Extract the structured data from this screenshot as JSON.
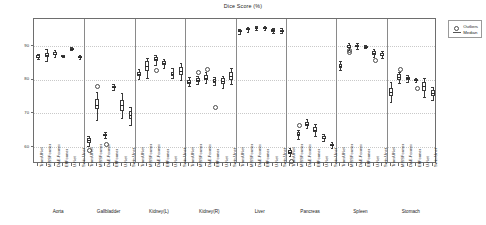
{
  "chart_data": {
    "type": "box",
    "title": "Dice Score (%)",
    "xlabel": "",
    "ylabel": "",
    "ylim": [
      55,
      98
    ],
    "yticks": [
      60,
      70,
      80,
      90
    ],
    "grid": true,
    "legend_position": "top-right",
    "legend": [
      {
        "label": "Outliers",
        "marker": "circle"
      },
      {
        "label": "Median",
        "marker": "line"
      }
    ],
    "models": [
      "TransUNet",
      "MISSFormer",
      "DAE-Former",
      "EffFormer",
      "U-Net",
      "Swin-Unet"
    ],
    "groups": [
      {
        "name": "Aorta",
        "boxes": [
          {
            "model": "TransUNet",
            "whisker_low": 86.0,
            "q1": 86.4,
            "median": 86.8,
            "q3": 87.2,
            "whisker_high": 87.6,
            "outliers": []
          },
          {
            "model": "MISSFormer",
            "whisker_low": 85.6,
            "q1": 86.8,
            "median": 87.4,
            "q3": 88.0,
            "whisker_high": 89.2,
            "outliers": []
          },
          {
            "model": "DAE-Former",
            "whisker_low": 86.6,
            "q1": 87.2,
            "median": 87.7,
            "q3": 88.2,
            "whisker_high": 88.8,
            "outliers": []
          },
          {
            "model": "EffFormer",
            "whisker_low": 86.6,
            "q1": 86.8,
            "median": 87.0,
            "q3": 87.2,
            "whisker_high": 87.4,
            "outliers": []
          },
          {
            "model": "U-Net",
            "whisker_low": 88.8,
            "q1": 89.0,
            "median": 89.2,
            "q3": 89.4,
            "whisker_high": 89.6,
            "outliers": []
          },
          {
            "model": "Swin-Unet",
            "whisker_low": 86.0,
            "q1": 86.3,
            "median": 86.6,
            "q3": 86.9,
            "whisker_high": 87.2,
            "outliers": []
          }
        ]
      },
      {
        "name": "Gallbladder",
        "boxes": [
          {
            "model": "TransUNet",
            "whisker_low": 60.4,
            "q1": 61.2,
            "median": 62.0,
            "q3": 62.8,
            "whisker_high": 63.4,
            "outliers": [
              59.2
            ]
          },
          {
            "model": "MISSFormer",
            "whisker_low": 68.0,
            "q1": 71.2,
            "median": 72.6,
            "q3": 74.2,
            "whisker_high": 76.4,
            "outliers": [
              78.4
            ]
          },
          {
            "model": "DAE-Former",
            "whisker_low": 62.8,
            "q1": 63.2,
            "median": 63.6,
            "q3": 64.0,
            "whisker_high": 64.4,
            "outliers": [
              61.0
            ]
          },
          {
            "model": "EffFormer",
            "whisker_low": 77.0,
            "q1": 77.4,
            "median": 77.8,
            "q3": 78.2,
            "whisker_high": 78.6,
            "outliers": []
          },
          {
            "model": "U-Net",
            "whisker_low": 68.6,
            "q1": 70.8,
            "median": 72.4,
            "q3": 74.0,
            "whisker_high": 76.0,
            "outliers": []
          },
          {
            "model": "Swin-Unet",
            "whisker_low": 66.6,
            "q1": 68.2,
            "median": 69.4,
            "q3": 70.6,
            "whisker_high": 72.0,
            "outliers": []
          }
        ]
      },
      {
        "name": "Kidney(L)",
        "boxes": [
          {
            "model": "TransUNet",
            "whisker_low": 80.2,
            "q1": 81.2,
            "median": 81.8,
            "q3": 82.4,
            "whisker_high": 83.2,
            "outliers": []
          },
          {
            "model": "MISSFormer",
            "whisker_low": 80.6,
            "q1": 82.6,
            "median": 84.0,
            "q3": 85.4,
            "whisker_high": 86.4,
            "outliers": []
          },
          {
            "model": "DAE-Former",
            "whisker_low": 84.4,
            "q1": 85.4,
            "median": 86.2,
            "q3": 86.8,
            "whisker_high": 87.4,
            "outliers": [
              83.0
            ]
          },
          {
            "model": "EffFormer",
            "whisker_low": 83.6,
            "q1": 84.4,
            "median": 85.0,
            "q3": 85.6,
            "whisker_high": 86.2,
            "outliers": []
          },
          {
            "model": "U-Net",
            "whisker_low": 80.4,
            "q1": 81.2,
            "median": 81.8,
            "q3": 82.4,
            "whisker_high": 83.4,
            "outliers": []
          },
          {
            "model": "Swin-Unet",
            "whisker_low": 79.8,
            "q1": 81.4,
            "median": 82.6,
            "q3": 83.8,
            "whisker_high": 85.0,
            "outliers": []
          }
        ]
      },
      {
        "name": "Kidney(R)",
        "boxes": [
          {
            "model": "TransUNet",
            "whisker_low": 78.0,
            "q1": 78.8,
            "median": 79.4,
            "q3": 80.0,
            "whisker_high": 80.8,
            "outliers": []
          },
          {
            "model": "MISSFormer",
            "whisker_low": 78.6,
            "q1": 79.2,
            "median": 79.8,
            "q3": 80.4,
            "whisker_high": 81.0,
            "outliers": [
              82.4
            ]
          },
          {
            "model": "DAE-Former",
            "whisker_low": 79.0,
            "q1": 79.8,
            "median": 80.6,
            "q3": 81.4,
            "whisker_high": 82.2,
            "outliers": [
              83.4
            ]
          },
          {
            "model": "EffFormer",
            "whisker_low": 78.4,
            "q1": 79.0,
            "median": 79.6,
            "q3": 80.2,
            "whisker_high": 80.8,
            "outliers": [
              72.0
            ]
          },
          {
            "model": "U-Net",
            "whisker_low": 77.6,
            "q1": 78.8,
            "median": 79.6,
            "q3": 80.4,
            "whisker_high": 81.2,
            "outliers": []
          },
          {
            "model": "Swin-Unet",
            "whisker_low": 78.6,
            "q1": 80.0,
            "median": 81.0,
            "q3": 82.2,
            "whisker_high": 83.4,
            "outliers": []
          }
        ]
      },
      {
        "name": "Liver",
        "boxes": [
          {
            "model": "TransUNet",
            "whisker_low": 93.6,
            "q1": 94.0,
            "median": 94.3,
            "q3": 94.6,
            "whisker_high": 95.0,
            "outliers": []
          },
          {
            "model": "MISSFormer",
            "whisker_low": 94.2,
            "q1": 94.6,
            "median": 94.9,
            "q3": 95.2,
            "whisker_high": 95.6,
            "outliers": []
          },
          {
            "model": "DAE-Former",
            "whisker_low": 94.8,
            "q1": 95.1,
            "median": 95.4,
            "q3": 95.7,
            "whisker_high": 96.0,
            "outliers": []
          },
          {
            "model": "EffFormer",
            "whisker_low": 94.6,
            "q1": 94.9,
            "median": 95.2,
            "q3": 95.5,
            "whisker_high": 95.8,
            "outliers": []
          },
          {
            "model": "U-Net",
            "whisker_low": 93.8,
            "q1": 94.2,
            "median": 94.6,
            "q3": 95.0,
            "whisker_high": 95.4,
            "outliers": []
          },
          {
            "model": "Swin-Unet",
            "whisker_low": 93.8,
            "q1": 94.2,
            "median": 94.5,
            "q3": 94.8,
            "whisker_high": 95.2,
            "outliers": []
          }
        ]
      },
      {
        "name": "Pancreas",
        "boxes": [
          {
            "model": "TransUNet",
            "whisker_low": 57.4,
            "q1": 58.0,
            "median": 58.6,
            "q3": 59.2,
            "whisker_high": 59.8,
            "outliers": [
              56.0
            ]
          },
          {
            "model": "MISSFormer",
            "whisker_low": 62.4,
            "q1": 63.2,
            "median": 63.8,
            "q3": 64.4,
            "whisker_high": 65.2,
            "outliers": [
              66.6
            ]
          },
          {
            "model": "DAE-Former",
            "whisker_low": 65.6,
            "q1": 66.4,
            "median": 67.0,
            "q3": 67.6,
            "whisker_high": 68.4,
            "outliers": []
          },
          {
            "model": "EffFormer",
            "whisker_low": 63.2,
            "q1": 64.4,
            "median": 65.2,
            "q3": 66.0,
            "whisker_high": 67.0,
            "outliers": []
          },
          {
            "model": "U-Net",
            "whisker_low": 61.8,
            "q1": 62.4,
            "median": 62.8,
            "q3": 63.2,
            "whisker_high": 63.8,
            "outliers": []
          },
          {
            "model": "Swin-Unet",
            "whisker_low": 59.6,
            "q1": 60.2,
            "median": 60.6,
            "q3": 61.0,
            "whisker_high": 61.6,
            "outliers": []
          }
        ]
      },
      {
        "name": "Spleen",
        "boxes": [
          {
            "model": "TransUNet",
            "whisker_low": 82.8,
            "q1": 83.6,
            "median": 84.2,
            "q3": 84.8,
            "whisker_high": 85.6,
            "outliers": []
          },
          {
            "model": "MISSFormer",
            "whisker_low": 88.8,
            "q1": 89.4,
            "median": 89.8,
            "q3": 90.2,
            "whisker_high": 90.8,
            "outliers": [
              89.0,
              88.4
            ]
          },
          {
            "model": "DAE-Former",
            "whisker_low": 89.0,
            "q1": 89.6,
            "median": 90.0,
            "q3": 90.4,
            "whisker_high": 91.0,
            "outliers": []
          },
          {
            "model": "EffFormer",
            "whisker_low": 89.4,
            "q1": 89.6,
            "median": 89.8,
            "q3": 90.0,
            "whisker_high": 90.2,
            "outliers": []
          },
          {
            "model": "U-Net",
            "whisker_low": 86.8,
            "q1": 87.4,
            "median": 87.9,
            "q3": 88.4,
            "whisker_high": 89.0,
            "outliers": [
              86.0
            ]
          },
          {
            "model": "Swin-Unet",
            "whisker_low": 86.4,
            "q1": 87.0,
            "median": 87.4,
            "q3": 87.8,
            "whisker_high": 88.4,
            "outliers": []
          }
        ]
      },
      {
        "name": "Stomach",
        "boxes": [
          {
            "model": "TransUNet",
            "whisker_low": 73.4,
            "q1": 75.2,
            "median": 76.4,
            "q3": 77.6,
            "whisker_high": 79.2,
            "outliers": []
          },
          {
            "model": "MISSFormer",
            "whisker_low": 79.0,
            "q1": 80.0,
            "median": 80.8,
            "q3": 81.6,
            "whisker_high": 82.4,
            "outliers": [
              83.4
            ]
          },
          {
            "model": "DAE-Former",
            "whisker_low": 79.4,
            "q1": 80.0,
            "median": 80.4,
            "q3": 80.8,
            "whisker_high": 81.4,
            "outliers": []
          },
          {
            "model": "EffFormer",
            "whisker_low": 79.2,
            "q1": 79.6,
            "median": 79.9,
            "q3": 80.2,
            "whisker_high": 80.6,
            "outliers": [
              77.8
            ]
          },
          {
            "model": "U-Net",
            "whisker_low": 74.8,
            "q1": 76.6,
            "median": 78.0,
            "q3": 79.4,
            "whisker_high": 80.6,
            "outliers": []
          },
          {
            "model": "Swin-Unet",
            "whisker_low": 74.0,
            "q1": 75.2,
            "median": 76.0,
            "q3": 76.8,
            "whisker_high": 77.8,
            "outliers": []
          }
        ]
      }
    ]
  }
}
